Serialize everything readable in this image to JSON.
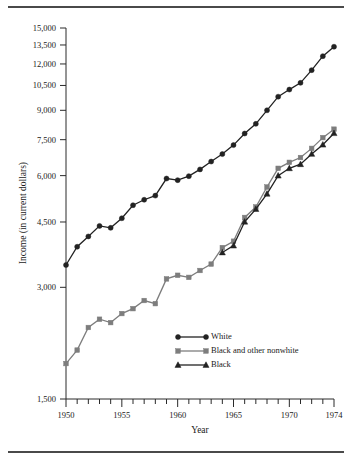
{
  "figure": {
    "top_rule": "rule",
    "bottom_rule": "rule"
  },
  "chart_data": {
    "type": "line",
    "title": "",
    "xlabel": "Year",
    "ylabel": "Income (in current dollars)",
    "x": [
      1950,
      1951,
      1952,
      1953,
      1954,
      1955,
      1956,
      1957,
      1958,
      1959,
      1960,
      1961,
      1962,
      1963,
      1964,
      1965,
      1966,
      1967,
      1968,
      1969,
      1970,
      1971,
      1972,
      1973,
      1974
    ],
    "xlim": [
      1950,
      1974
    ],
    "xticks": [
      1950,
      1951,
      1952,
      1953,
      1954,
      1955,
      1956,
      1957,
      1958,
      1959,
      1960,
      1961,
      1962,
      1963,
      1964,
      1965,
      1966,
      1967,
      1968,
      1969,
      1970,
      1971,
      1972,
      1973,
      1974
    ],
    "xtick_labels": [
      "1950",
      "",
      "",
      "",
      "",
      "1955",
      "",
      "",
      "",
      "",
      "1960",
      "",
      "",
      "",
      "",
      "1965",
      "",
      "",
      "",
      "",
      "1970",
      "",
      "",
      "",
      "1974"
    ],
    "yticks": [
      1500,
      3000,
      4500,
      6000,
      7500,
      9000,
      10500,
      12000,
      13500,
      15000
    ],
    "ytick_labels": [
      "1,500",
      "3,000",
      "4,500",
      "6,000",
      "7,500",
      "9,000",
      "10,500",
      "12,000",
      "13,500",
      "15,000"
    ],
    "yscale": "log",
    "ylim": [
      1500,
      15000
    ],
    "grid": false,
    "legend_position": "center",
    "series": [
      {
        "name": "White",
        "marker": "circle",
        "color": "#222222",
        "values": [
          3445,
          3859,
          4114,
          4392,
          4339,
          4605,
          4993,
          5166,
          5300,
          5893,
          5835,
          5981,
          6237,
          6548,
          6858,
          7251,
          7792,
          8274,
          9000,
          9794,
          10236,
          10672,
          11549,
          12595,
          13356
        ]
      },
      {
        "name": "Black and other nonwhite",
        "marker": "square",
        "color": "#7d7d7d",
        "values": [
          1869,
          2032,
          2338,
          2461,
          2410,
          2549,
          2628,
          2764,
          2711,
          3161,
          3233,
          3191,
          3330,
          3465,
          3839,
          3994,
          4628,
          4939,
          5590,
          6279,
          6516,
          6714,
          7106,
          7596,
          8006
        ]
      },
      {
        "name": "Black",
        "marker": "triangle",
        "color": "#222222",
        "values": [
          null,
          null,
          null,
          null,
          null,
          null,
          null,
          null,
          null,
          null,
          null,
          null,
          null,
          null,
          3724,
          3886,
          4507,
          4875,
          5360,
          5999,
          6279,
          6440,
          6864,
          7269,
          7808
        ]
      }
    ]
  },
  "legend": {
    "items": [
      {
        "label": "White",
        "marker": "circle",
        "color": "#222222"
      },
      {
        "label": "Black and other nonwhite",
        "marker": "square",
        "color": "#7d7d7d"
      },
      {
        "label": "Black",
        "marker": "triangle",
        "color": "#222222"
      }
    ]
  },
  "axes": {
    "x_title": "Year",
    "y_title": "Income (in current dollars)"
  }
}
